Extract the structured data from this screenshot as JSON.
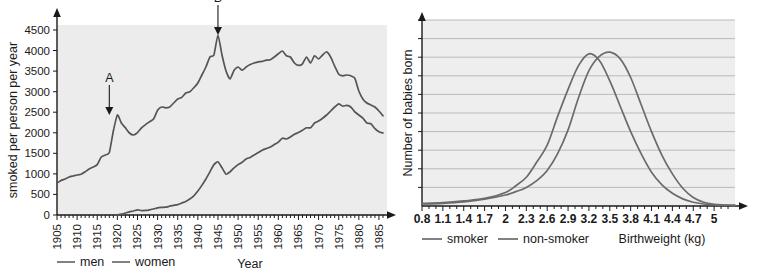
{
  "figure": {
    "title": "",
    "panels": [
      "cigarettes-smoked-per-person-per-year",
      "birthweight-distribution"
    ]
  },
  "left_panel": {
    "ylabel": "smoked per person per year",
    "xlabel": "Year",
    "yticks": [
      "0",
      "500",
      "1000",
      "1500",
      "2000",
      "2500",
      "3000",
      "3500",
      "4000",
      "4500"
    ],
    "xticks": [
      "1905",
      "1910",
      "1915",
      "1920",
      "1925",
      "1930",
      "1935",
      "1940",
      "1945",
      "1950",
      "1955",
      "1960",
      "1965",
      "1970",
      "1975",
      "1980",
      "1985"
    ],
    "legend": [
      {
        "label": "men",
        "color": "#6b6b6b"
      },
      {
        "label": "women",
        "color": "#6b6b6b"
      }
    ],
    "annotations": [
      {
        "label": "A",
        "x": 1918,
        "y": 2500
      },
      {
        "label": "B",
        "x": 1945,
        "y": 4500
      }
    ]
  },
  "right_panel": {
    "ylabel": "Number of babies born",
    "xlabel": "Birthweight (kg)",
    "xticks": [
      "0.8",
      "1.1",
      "1.4",
      "1.7",
      "2",
      "2.3",
      "2.6",
      "2.9",
      "3.2",
      "3.5",
      "3.8",
      "4.1",
      "4.4",
      "4.7",
      "5"
    ],
    "legend": [
      {
        "label": "smoker",
        "color": "#6b6b6b"
      },
      {
        "label": "non-smoker",
        "color": "#8c8c8c"
      }
    ]
  },
  "chart_data": [
    {
      "type": "line",
      "title": "",
      "xlabel": "Year",
      "ylabel": "smoked per person per year",
      "xlim": [
        1905,
        1987
      ],
      "ylim": [
        0,
        4750
      ],
      "grid": false,
      "legend_position": "bottom-left",
      "annotations": [
        {
          "label": "A",
          "x": 1918,
          "y": 2500,
          "note": "arrow pointing down to peak A"
        },
        {
          "label": "B",
          "x": 1945,
          "y": 4500,
          "note": "arrow pointing down to peak B"
        }
      ],
      "series": [
        {
          "name": "men",
          "color": "#6b6b6b",
          "x": [
            1905,
            1906,
            1907,
            1908,
            1909,
            1910,
            1911,
            1912,
            1913,
            1914,
            1915,
            1916,
            1917,
            1918,
            1919,
            1920,
            1921,
            1922,
            1923,
            1924,
            1925,
            1926,
            1927,
            1928,
            1929,
            1930,
            1931,
            1932,
            1933,
            1934,
            1935,
            1936,
            1937,
            1938,
            1939,
            1940,
            1941,
            1942,
            1943,
            1944,
            1945,
            1946,
            1947,
            1948,
            1949,
            1950,
            1951,
            1952,
            1953,
            1954,
            1955,
            1956,
            1957,
            1958,
            1959,
            1960,
            1961,
            1962,
            1963,
            1964,
            1965,
            1966,
            1967,
            1968,
            1969,
            1970,
            1971,
            1972,
            1973,
            1974,
            1975,
            1976,
            1977,
            1978,
            1979,
            1980,
            1981,
            1982,
            1983,
            1984,
            1985,
            1986
          ],
          "y": [
            800,
            860,
            900,
            950,
            975,
            1000,
            1020,
            1080,
            1150,
            1200,
            1260,
            1450,
            1500,
            1560,
            2100,
            2500,
            2300,
            2180,
            2050,
            2000,
            2060,
            2180,
            2260,
            2330,
            2400,
            2620,
            2700,
            2680,
            2700,
            2800,
            2900,
            2940,
            3050,
            3080,
            3180,
            3300,
            3500,
            3700,
            3950,
            4000,
            4500,
            4000,
            3600,
            3400,
            3620,
            3700,
            3620,
            3700,
            3760,
            3800,
            3830,
            3840,
            3870,
            3880,
            3950,
            4030,
            4100,
            3980,
            3950,
            3800,
            3740,
            3780,
            3950,
            3800,
            3980,
            3900,
            4000,
            4080,
            3950,
            3720,
            3520,
            3480,
            3500,
            3480,
            3420,
            3100,
            2900,
            2800,
            2750,
            2700,
            2600,
            2480
          ]
        },
        {
          "name": "women",
          "color": "#6b6b6b",
          "x": [
            1920,
            1921,
            1922,
            1923,
            1924,
            1925,
            1926,
            1927,
            1928,
            1929,
            1930,
            1931,
            1932,
            1933,
            1934,
            1935,
            1936,
            1937,
            1938,
            1939,
            1940,
            1941,
            1942,
            1943,
            1944,
            1945,
            1946,
            1947,
            1948,
            1949,
            1950,
            1951,
            1952,
            1953,
            1954,
            1955,
            1956,
            1957,
            1958,
            1959,
            1960,
            1961,
            1962,
            1963,
            1964,
            1965,
            1966,
            1967,
            1968,
            1969,
            1970,
            1971,
            1972,
            1973,
            1974,
            1975,
            1976,
            1977,
            1978,
            1979,
            1980,
            1981,
            1982,
            1983,
            1984,
            1985,
            1986
          ],
          "y": [
            0,
            20,
            50,
            80,
            100,
            130,
            110,
            115,
            130,
            150,
            180,
            190,
            195,
            220,
            240,
            260,
            300,
            340,
            400,
            480,
            600,
            740,
            900,
            1080,
            1260,
            1330,
            1180,
            1020,
            1080,
            1180,
            1260,
            1320,
            1400,
            1440,
            1500,
            1560,
            1620,
            1660,
            1700,
            1760,
            1820,
            1920,
            1900,
            1950,
            2020,
            2060,
            2120,
            2180,
            2180,
            2300,
            2350,
            2420,
            2500,
            2600,
            2700,
            2780,
            2720,
            2740,
            2700,
            2580,
            2500,
            2420,
            2300,
            2280,
            2160,
            2080,
            2050
          ]
        }
      ]
    },
    {
      "type": "line",
      "title": "",
      "xlabel": "Birthweight (kg)",
      "ylabel": "Number of babies born",
      "xlim": [
        0.8,
        5.3
      ],
      "ylim": [
        0,
        11
      ],
      "grid": true,
      "grid_axis": "y",
      "grid_lines": 10,
      "legend_position": "bottom-left",
      "yticks_labeled": false,
      "series": [
        {
          "name": "smoker",
          "color": "#6b6b6b",
          "peak_x": 3.2,
          "peak_y": 9.0,
          "x": [
            0.8,
            1.1,
            1.4,
            1.7,
            2.0,
            2.15,
            2.3,
            2.45,
            2.6,
            2.75,
            2.9,
            3.05,
            3.2,
            3.35,
            3.5,
            3.65,
            3.8,
            3.95,
            4.1,
            4.25,
            4.4,
            4.55,
            4.7,
            4.85,
            5.0,
            5.15,
            5.3
          ],
          "y": [
            0.15,
            0.2,
            0.3,
            0.45,
            0.8,
            1.2,
            1.7,
            2.6,
            3.6,
            5.3,
            6.9,
            8.3,
            9.0,
            8.6,
            7.4,
            5.9,
            4.4,
            3.1,
            2.0,
            1.25,
            0.75,
            0.42,
            0.22,
            0.12,
            0.07,
            0.05,
            0.04
          ]
        },
        {
          "name": "non-smoker",
          "color": "#8c8c8c",
          "peak_x": 3.5,
          "peak_y": 9.1,
          "x": [
            0.8,
            1.1,
            1.4,
            1.7,
            2.0,
            2.15,
            2.3,
            2.45,
            2.6,
            2.75,
            2.9,
            3.05,
            3.2,
            3.35,
            3.5,
            3.65,
            3.8,
            3.95,
            4.1,
            4.25,
            4.4,
            4.55,
            4.7,
            4.85,
            5.0,
            5.15,
            5.3
          ],
          "y": [
            0.12,
            0.16,
            0.24,
            0.4,
            0.65,
            0.85,
            1.1,
            1.5,
            2.1,
            3.1,
            4.5,
            6.4,
            8.0,
            8.85,
            9.1,
            8.7,
            7.6,
            6.0,
            4.4,
            3.0,
            1.9,
            1.05,
            0.5,
            0.22,
            0.1,
            0.06,
            0.04
          ]
        }
      ]
    }
  ]
}
